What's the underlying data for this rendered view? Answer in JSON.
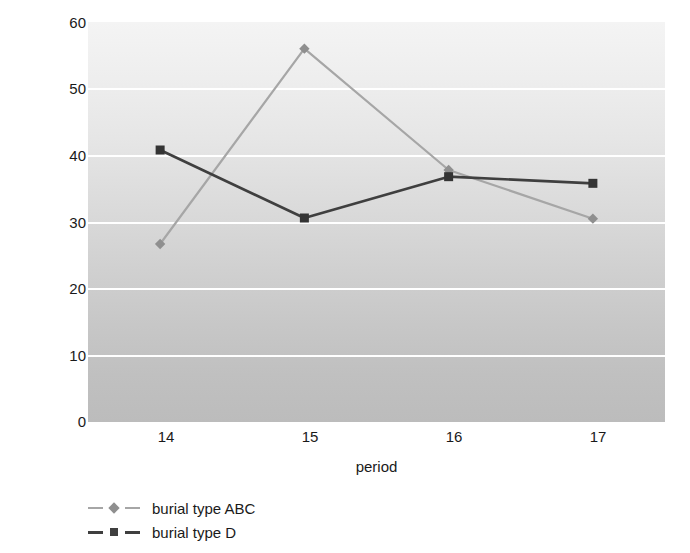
{
  "chart_data": {
    "type": "line",
    "title": "",
    "xlabel": "period",
    "ylabel": "% observable orbits affected",
    "categories": [
      "14",
      "15",
      "16",
      "17"
    ],
    "x": [
      14,
      15,
      16,
      17
    ],
    "xlim": [
      13.5,
      17.5
    ],
    "ylim": [
      0,
      60
    ],
    "yticks": [
      0,
      10,
      20,
      30,
      40,
      50,
      60
    ],
    "ytick_labels": [
      "0",
      "10",
      "20",
      "30",
      "40",
      "50",
      "60"
    ],
    "xtick_labels": [
      "14",
      "15",
      "16",
      "17"
    ],
    "grid": "horizontal-white",
    "legend_position": "below-left",
    "series": [
      {
        "name": "burial type ABC",
        "values": [
          26.7,
          56.0,
          37.8,
          30.5
        ],
        "color": "#a6a6a6",
        "marker": "diamond"
      },
      {
        "name": "burial type D",
        "values": [
          40.8,
          30.6,
          36.8,
          35.8
        ],
        "color": "#3f3f3f",
        "marker": "square"
      }
    ]
  },
  "axes": {
    "y_title": "% observable orbits affected",
    "x_title": "period",
    "y_ticks": [
      "60",
      "50",
      "40",
      "30",
      "20",
      "10",
      "0"
    ],
    "x_ticks": [
      "14",
      "15",
      "16",
      "17"
    ]
  },
  "legend": {
    "items": [
      {
        "label": "burial type ABC",
        "color": "#a6a6a6",
        "marker": "diamond-icon"
      },
      {
        "label": "burial type D",
        "color": "#3f3f3f",
        "marker": "square-icon"
      }
    ]
  },
  "colors": {
    "series_abc": "#a6a6a6",
    "series_d": "#3f3f3f",
    "gridline": "#ffffff",
    "plot_bg_top": "#f4f4f4",
    "plot_bg_bottom": "#bcbcbc",
    "text": "#1a1a1a"
  }
}
